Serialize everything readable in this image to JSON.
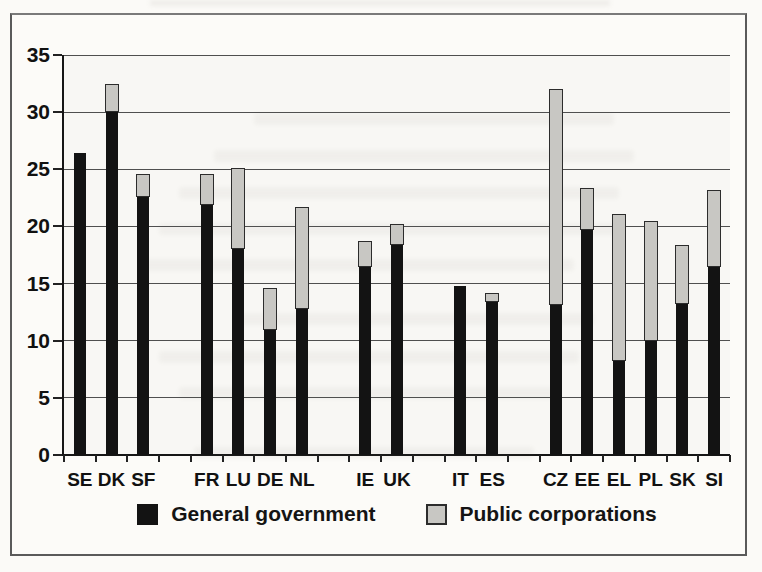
{
  "chart_data": {
    "type": "bar",
    "stacked": true,
    "title": "",
    "xlabel": "",
    "ylabel": "",
    "categories": [
      "SE",
      "DK",
      "SF",
      "FR",
      "LU",
      "DE",
      "NL",
      "IE",
      "UK",
      "IT",
      "ES",
      "CZ",
      "EE",
      "EL",
      "PL",
      "SK",
      "SI"
    ],
    "slots": [
      0,
      1,
      2,
      4,
      5,
      6,
      7,
      9,
      10,
      12,
      13,
      15,
      16,
      17,
      18,
      19,
      20
    ],
    "total_slots": 21,
    "series": [
      {
        "name": "General government",
        "color": "#131313",
        "values": [
          26.4,
          30.1,
          22.7,
          22.0,
          18.1,
          11.0,
          12.9,
          16.5,
          18.5,
          14.8,
          13.5,
          13.2,
          19.8,
          8.3,
          10.1,
          13.3,
          16.5
        ]
      },
      {
        "name": "Public corporations",
        "color": "#c8c7c3",
        "values": [
          0,
          2.4,
          1.9,
          2.6,
          7.0,
          3.6,
          8.8,
          2.2,
          1.7,
          0,
          0.7,
          18.8,
          3.6,
          12.8,
          10.4,
          5.1,
          6.7
        ]
      }
    ],
    "yticks": [
      0,
      5,
      10,
      15,
      20,
      25,
      30,
      35
    ],
    "ylim": [
      0,
      35
    ],
    "grid": true,
    "legend_position": "bottom"
  },
  "colors": {
    "bar_black": "#131313",
    "bar_gray": "#c8c7c3",
    "gridline": "#4f4f4f",
    "axis": "#161616",
    "page_background": "#fbfaf7",
    "box_border": "#5a5a5a"
  }
}
